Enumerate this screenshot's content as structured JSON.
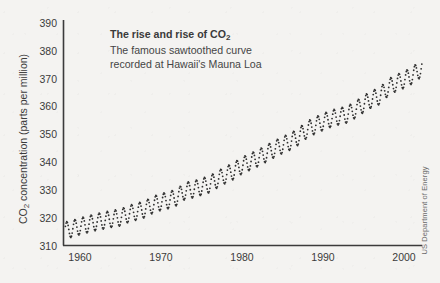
{
  "figure": {
    "background_color": "#f4f3f1",
    "ink_color": "#3b3b3b",
    "credit": "US Department of Energy"
  },
  "annotation": {
    "line1_pre": "The rise and rise of CO",
    "line1_sub": "2",
    "line2": "The famous sawtoothed curve",
    "line3": "recorded at Hawaii's Mauna Loa"
  },
  "axis": {
    "y_title_pre": "CO",
    "y_title_sub": "2",
    "y_title_post": " concentration (parts per million)"
  },
  "chart_data": {
    "type": "line",
    "title": "The rise and rise of CO2",
    "subtitle": "The famous sawtoothed curve recorded at Hawaii's Mauna Loa",
    "xlabel": "",
    "ylabel": "CO2 concentration (parts per million)",
    "xlim": [
      1957.0,
      2006.0
    ],
    "ylim": [
      310,
      390
    ],
    "yticks": [
      310,
      320,
      330,
      340,
      350,
      360,
      370,
      380,
      390
    ],
    "ytick_labels": [
      "310",
      "320",
      "330",
      "340",
      "350",
      "360",
      "370",
      "380",
      "390"
    ],
    "xticks": [
      1960,
      1970,
      1980,
      1990,
      2000
    ],
    "xtick_labels": [
      "1960",
      "1970",
      "1980",
      "1990",
      "2000"
    ],
    "grid": false,
    "legend": null,
    "marker": "small-dot",
    "marker_color": "#2f2f2f",
    "series": [
      {
        "name": "Mauna Loa monthly mean CO2",
        "description": "Keeling curve: annual mean trend rising from ~315.6 ppm in 1959 to ~377.5 ppm in 2004, with a seasonal sawtooth of about +/-3 ppm peaking in May and troughing in September.",
        "seasonal_amplitude_ppm": 6.0,
        "annual_means": {
          "x": [
            1958,
            1959,
            1960,
            1961,
            1962,
            1963,
            1964,
            1965,
            1966,
            1967,
            1968,
            1969,
            1970,
            1971,
            1972,
            1973,
            1974,
            1975,
            1976,
            1977,
            1978,
            1979,
            1980,
            1981,
            1982,
            1983,
            1984,
            1985,
            1986,
            1987,
            1988,
            1989,
            1990,
            1991,
            1992,
            1993,
            1994,
            1995,
            1996,
            1997,
            1998,
            1999,
            2000,
            2001,
            2002,
            2003,
            2004,
            2005
          ],
          "y": [
            315.3,
            315.98,
            316.91,
            317.64,
            318.45,
            318.99,
            319.62,
            320.04,
            321.38,
            322.16,
            323.04,
            324.62,
            325.68,
            326.32,
            327.45,
            329.68,
            330.18,
            331.11,
            332.04,
            333.83,
            335.4,
            336.84,
            338.75,
            340.11,
            341.45,
            343.05,
            344.65,
            346.12,
            347.42,
            349.19,
            351.57,
            353.12,
            354.39,
            355.61,
            356.45,
            357.1,
            358.83,
            360.82,
            362.61,
            363.73,
            366.7,
            368.38,
            369.55,
            371.14,
            373.28,
            375.8,
            377.52,
            379.8
          ]
        }
      }
    ]
  }
}
